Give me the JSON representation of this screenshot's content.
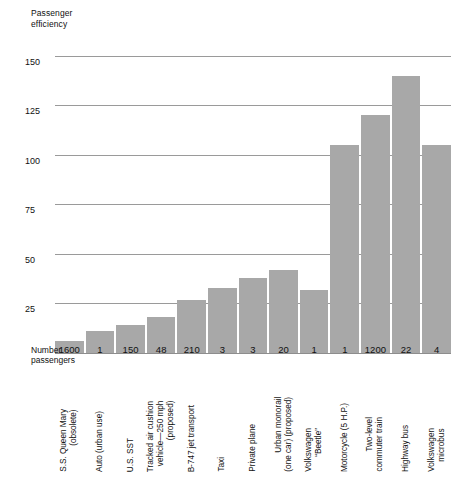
{
  "chart_data": {
    "type": "bar",
    "title": "",
    "ylabel": "Passenger\nefficiency",
    "xlabel": "Number\npassengers",
    "ylim": [
      0,
      158
    ],
    "yticks": [
      25,
      50,
      75,
      100,
      125,
      150
    ],
    "grid": true,
    "legend": null,
    "bar_color": "#a8a8a8",
    "categories": [
      "S.S. Queen Mary\n(obsolete)",
      "Auto (urban use)",
      "U.S. SST",
      "Tracked air cushion\nvehicle—250 mph\n(proposed)",
      "B-747 jet transport",
      "Taxi",
      "Private plane",
      "Urban monorail\n(one car) (proposed)",
      "Volkswagen\n“Beetle”",
      "Motorcycle (5 H.P.)",
      "Two-level\ncommuter train",
      "Highway bus",
      "Volkswagen\nmicrobus"
    ],
    "values": [
      6,
      11,
      14,
      18,
      27,
      33,
      38,
      42,
      32,
      105,
      120,
      140,
      105
    ],
    "passenger_counts": [
      "1600",
      "1",
      "150",
      "48",
      "210",
      "3",
      "3",
      "20",
      "1",
      "1",
      "1200",
      "22",
      "4"
    ]
  },
  "axis": {
    "y_title": "Passenger\nefficiency",
    "x_title": "Number\npassengers",
    "tick_labels": [
      "150",
      "125",
      "100",
      "75",
      "50",
      "25"
    ]
  }
}
